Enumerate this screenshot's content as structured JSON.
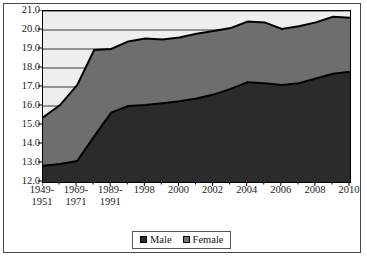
{
  "chart_data": {
    "type": "area",
    "stacked": true,
    "title": "",
    "subtitle": "",
    "xlabel": "",
    "ylabel": "",
    "grid": true,
    "legend_position": "bottom",
    "ylim": [
      12.0,
      21.0
    ],
    "ytick_step": 1.0,
    "yticks": [
      "12.0",
      "13.0",
      "14.0",
      "15.0",
      "16.0",
      "17.0",
      "18.0",
      "19.0",
      "20.0",
      "21.0"
    ],
    "categories": [
      "1949-1951",
      "",
      "1969-1971",
      "",
      "1989-1991",
      "",
      "1998",
      "",
      "2000",
      "",
      "2002",
      "",
      "2004",
      "",
      "2006",
      "",
      "2008",
      "",
      "2010"
    ],
    "xtick_labels": [
      {
        "line1": "1949-",
        "line2": "1951"
      },
      {
        "line1": "1969-",
        "line2": "1971"
      },
      {
        "line1": "1989-",
        "line2": "1991"
      },
      {
        "line1": "1998",
        "line2": ""
      },
      {
        "line1": "2000",
        "line2": ""
      },
      {
        "line1": "2002",
        "line2": ""
      },
      {
        "line1": "2004",
        "line2": ""
      },
      {
        "line1": "2006",
        "line2": ""
      },
      {
        "line1": "2008",
        "line2": ""
      },
      {
        "line1": "2010",
        "line2": ""
      }
    ],
    "series": [
      {
        "name": "Male",
        "color": "#2b2b2b",
        "values": [
          12.85,
          12.95,
          13.1,
          14.4,
          15.65,
          16.0,
          16.05,
          16.15,
          16.25,
          16.4,
          16.6,
          16.9,
          17.25,
          17.2,
          17.1,
          17.2,
          17.45,
          17.7,
          17.8
        ]
      },
      {
        "name": "Female",
        "color": "#6e6e6e",
        "values": [
          2.55,
          3.1,
          4.0,
          4.55,
          3.35,
          3.4,
          3.5,
          3.35,
          3.35,
          3.4,
          3.35,
          3.2,
          3.2,
          3.2,
          2.95,
          3.0,
          2.95,
          3.0,
          2.85
        ]
      }
    ],
    "totals": [
      15.4,
      16.05,
      17.1,
      18.95,
      19.0,
      19.4,
      19.55,
      19.5,
      19.6,
      19.8,
      19.95,
      20.1,
      20.45,
      20.4,
      20.05,
      20.2,
      20.4,
      20.7,
      20.65
    ]
  },
  "legend": {
    "items": [
      {
        "label": "Male",
        "color": "#2b2b2b"
      },
      {
        "label": "Female",
        "color": "#6e6e6e"
      }
    ]
  },
  "plot": {
    "background": "#eeeeee",
    "gridline_color": "#3a3a3a",
    "axis_color": "#000000",
    "frame_color": "#4a4a4a"
  }
}
